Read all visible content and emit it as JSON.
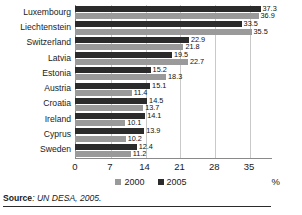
{
  "figure": {
    "source_prefix": "Source",
    "source_text": ": UN DESA, 2005.",
    "percent_symbol": "%"
  },
  "legend": {
    "items": [
      {
        "label": "2000",
        "color": "#9a9a9a"
      },
      {
        "label": "2005",
        "color": "#2b2b2b"
      }
    ]
  },
  "chart_data": {
    "type": "bar",
    "orientation": "horizontal",
    "title": "",
    "xlabel": "%",
    "ylabel": "",
    "xlim": [
      0,
      37.8
    ],
    "xticks": [
      0,
      7,
      14,
      21,
      28,
      35
    ],
    "grid": true,
    "legend_position": "bottom-center",
    "categories": [
      "Luxembourg",
      "Liechtenstein",
      "Switzerland",
      "Latvia",
      "Estonia",
      "Austria",
      "Croatia",
      "Ireland",
      "Cyprus",
      "Sweden"
    ],
    "series": [
      {
        "name": "2005",
        "color": "#2b2b2b",
        "values": [
          37.3,
          33.5,
          22.9,
          19.5,
          15.2,
          15.1,
          14.5,
          14.1,
          13.9,
          12.4
        ]
      },
      {
        "name": "2000",
        "color": "#9a9a9a",
        "values": [
          36.9,
          35.5,
          21.8,
          22.7,
          18.3,
          11.4,
          13.7,
          10.1,
          10.2,
          11.2
        ]
      }
    ]
  }
}
